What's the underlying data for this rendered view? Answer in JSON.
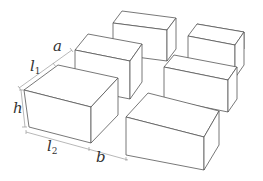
{
  "diagram": {
    "grid": {
      "rows": 3,
      "columns": 2
    },
    "labels": {
      "a": "a",
      "l1_base": "l",
      "l1_sub": "1",
      "h": "h",
      "l2_base": "l",
      "l2_sub": "2",
      "b": "b"
    },
    "label_meanings": {
      "a": "gap between boxes along depth",
      "l1": "box depth",
      "h": "box height",
      "l2": "box length",
      "b": "gap between boxes along length"
    },
    "colors": {
      "edge": "#555555",
      "face": "#ffffff",
      "dimension_line": "#9a9a9a",
      "text": "#333333"
    }
  }
}
